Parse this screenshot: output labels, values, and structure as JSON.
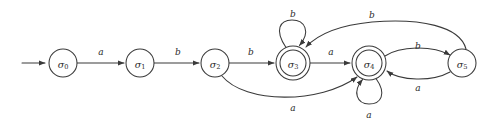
{
  "figure": {
    "type": "finite-state-automaton-diagram",
    "background_color": "#ffffff",
    "stroke_color": "#3a3a3a",
    "text_color": "#2b2b2b",
    "width": 489,
    "height": 123
  },
  "states": [
    {
      "id": "s0",
      "label_base": "σ",
      "label_sub": "0",
      "cx": 63,
      "cy": 63,
      "r": 14,
      "accepting": false,
      "initial": true
    },
    {
      "id": "s1",
      "label_base": "σ",
      "label_sub": "1",
      "cx": 140,
      "cy": 63,
      "r": 14,
      "accepting": false,
      "initial": false
    },
    {
      "id": "s2",
      "label_base": "σ",
      "label_sub": "2",
      "cx": 215,
      "cy": 63,
      "r": 14,
      "accepting": false,
      "initial": false
    },
    {
      "id": "s3",
      "label_base": "σ",
      "label_sub": "3",
      "cx": 293,
      "cy": 63,
      "r": 17,
      "accepting": true,
      "initial": false
    },
    {
      "id": "s4",
      "label_base": "σ",
      "label_sub": "4",
      "cx": 369,
      "cy": 63,
      "r": 17,
      "accepting": true,
      "initial": false
    },
    {
      "id": "s5",
      "label_base": "σ",
      "label_sub": "5",
      "cx": 462,
      "cy": 63,
      "r": 14,
      "accepting": false,
      "initial": false
    }
  ],
  "start_arrow": {
    "x1": 22,
    "y1": 63,
    "x2": 47,
    "y2": 63
  },
  "transitions": [
    {
      "id": "t0",
      "from": "s0",
      "to": "s1",
      "symbol": "a",
      "label_x": 101,
      "label_y": 52
    },
    {
      "id": "t1",
      "from": "s1",
      "to": "s2",
      "symbol": "b",
      "label_x": 178,
      "label_y": 52
    },
    {
      "id": "t2",
      "from": "s2",
      "to": "s3",
      "symbol": "b",
      "label_x": 251,
      "label_y": 52
    },
    {
      "id": "t3",
      "from": "s3",
      "to": "s4",
      "symbol": "a",
      "label_x": 331,
      "label_y": 52
    },
    {
      "id": "t4",
      "from": "s3",
      "to": "s3",
      "symbol": "b",
      "label_x": 293,
      "label_y": 14,
      "kind": "self-loop-up"
    },
    {
      "id": "t5",
      "from": "s4",
      "to": "s4",
      "symbol": "a",
      "label_x": 369,
      "label_y": 115,
      "kind": "self-loop-down"
    },
    {
      "id": "t6",
      "from": "s2",
      "to": "s4",
      "symbol": "a",
      "label_x": 293,
      "label_y": 108,
      "kind": "arc-below"
    },
    {
      "id": "t7",
      "from": "s4",
      "to": "s5",
      "symbol": "b",
      "label_x": 418,
      "label_y": 47,
      "kind": "arc-above"
    },
    {
      "id": "t8",
      "from": "s5",
      "to": "s4",
      "symbol": "a",
      "label_x": 418,
      "label_y": 87,
      "kind": "arc-below"
    },
    {
      "id": "t9",
      "from": "s5",
      "to": "s3",
      "symbol": "b",
      "label_x": 372,
      "label_y": 16,
      "kind": "arc-above-long"
    }
  ],
  "alphabet": [
    "a",
    "b"
  ]
}
